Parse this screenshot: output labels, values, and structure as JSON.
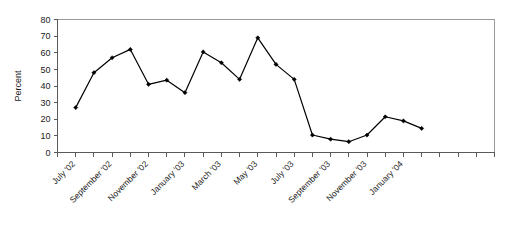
{
  "chart_data": {
    "type": "line",
    "title": "",
    "subtitle": "",
    "xlabel": "",
    "ylabel": "Percent",
    "ylim": [
      0,
      80
    ],
    "ytick_values": [
      0,
      10,
      20,
      30,
      40,
      50,
      60,
      70,
      80
    ],
    "ytick_labels": [
      "0",
      "10",
      "20",
      "30",
      "40",
      "50",
      "60",
      "70",
      "80"
    ],
    "grid": false,
    "legend": null,
    "legend_position": "none",
    "x": [
      "July '02",
      "August '02",
      "September '02",
      "October '02",
      "November '02",
      "December '02",
      "January '03",
      "February '03",
      "March '03",
      "April '03",
      "May '03",
      "June '03",
      "July '03",
      "August '03",
      "September '03",
      "October '03",
      "November '03",
      "December '03",
      "January '04",
      "February '04"
    ],
    "xtick_labels": [
      "July '02",
      "September '02",
      "November '02",
      "January '03",
      "March '03",
      "May '03",
      "July '03",
      "September '03",
      "November '03",
      "January '04"
    ],
    "xtick_label_every": 2,
    "xtick_rotation_deg": 45,
    "values": [
      27,
      48,
      57,
      62,
      41,
      43.5,
      36,
      60.5,
      54,
      44,
      69,
      53,
      44,
      10.5,
      8,
      6.5,
      10.5,
      21.5,
      19,
      14.5
    ],
    "series": [
      {
        "name": "Percent",
        "values": [
          27,
          48,
          57,
          62,
          41,
          43.5,
          36,
          60.5,
          54,
          44,
          69,
          53,
          44,
          10.5,
          8,
          6.5,
          10.5,
          21.5,
          19,
          14.5
        ],
        "color": "#000000",
        "marker": "filled-diamond"
      }
    ],
    "annotations": []
  },
  "colors": {
    "line": "#000000",
    "marker": "#000000",
    "axis": "#5a5a5a",
    "frame": "#9a9a9a",
    "text": "#1a1a1a",
    "background": "#ffffff"
  }
}
